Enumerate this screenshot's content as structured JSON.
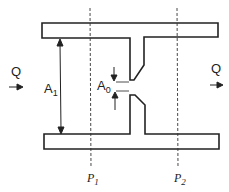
{
  "diagram": {
    "colors": {
      "stroke": "#222222",
      "background": "#ffffff"
    },
    "inlet": {
      "label": "Q",
      "arrow": "right-arrow"
    },
    "outlet": {
      "label": "Q",
      "arrow": "right-arrow"
    },
    "pipe_area": {
      "label": "A",
      "subscript": "1"
    },
    "orifice_area": {
      "label": "A",
      "subscript": "0"
    },
    "pressure_taps": [
      {
        "label": "P",
        "subscript": "1"
      },
      {
        "label": "P",
        "subscript": "2"
      }
    ]
  }
}
